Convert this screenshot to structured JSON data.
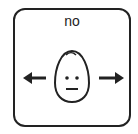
{
  "card": {
    "label": "no",
    "icons": [
      "left-arrow-icon",
      "neutral-face-icon",
      "right-arrow-icon"
    ],
    "colors": {
      "stroke": "#222222",
      "background": "#ffffff"
    }
  }
}
